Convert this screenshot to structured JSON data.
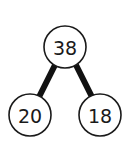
{
  "diagram": {
    "type": "number-bond",
    "whole": {
      "label": "38"
    },
    "parts": [
      {
        "label": "20"
      },
      {
        "label": "18"
      }
    ],
    "colors": {
      "stroke": "#1a1a1a",
      "fill": "#ffffff",
      "edge": "#111111"
    }
  }
}
